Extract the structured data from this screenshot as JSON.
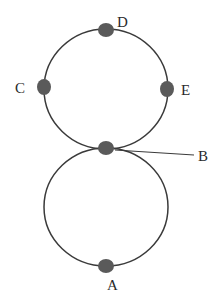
{
  "diagram": {
    "type": "figure-eight-track",
    "colors": {
      "background": "#ffffff",
      "stroke": "#3a3a3a",
      "node_fill": "#5a5a5a",
      "label": "#2a2a2a"
    },
    "loops": [
      {
        "name": "upper-loop",
        "cx": 106,
        "cy": 89,
        "rx": 62,
        "ry": 60
      },
      {
        "name": "lower-loop",
        "cx": 106,
        "cy": 207,
        "rx": 62,
        "ry": 59
      }
    ],
    "nodes": [
      {
        "id": "D",
        "label": "D",
        "x": 106,
        "y": 30,
        "label_x": 117,
        "label_y": 27
      },
      {
        "id": "C",
        "label": "C",
        "x": 44,
        "y": 87,
        "label_x": 15,
        "label_y": 93
      },
      {
        "id": "E",
        "label": "E",
        "x": 167,
        "y": 89,
        "label_x": 181,
        "label_y": 95
      },
      {
        "id": "B",
        "label": "B",
        "x": 106,
        "y": 148,
        "label_x": 198,
        "label_y": 161
      },
      {
        "id": "A",
        "label": "A",
        "x": 106,
        "y": 266,
        "label_x": 107,
        "label_y": 290
      }
    ],
    "leader_line": {
      "from_node": "B",
      "x1": 115,
      "y1": 150,
      "x2": 194,
      "y2": 155
    }
  }
}
